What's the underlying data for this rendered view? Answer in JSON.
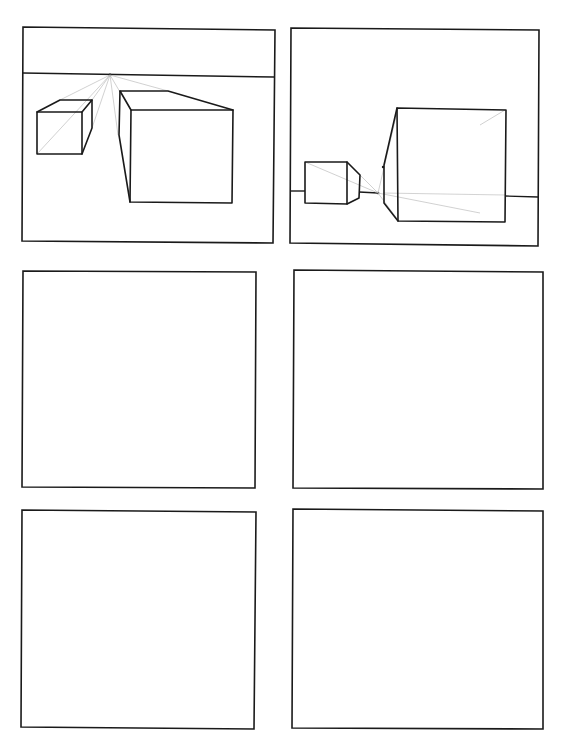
{
  "worksheet": {
    "layout": {
      "rows": 3,
      "columns": 2
    },
    "colors": {
      "ink": "#1a1a1a",
      "construction_lines": "#bdbdbd",
      "paper": "#ffffff"
    },
    "panels": [
      {
        "id": "panel-1",
        "position": "top-left",
        "content": "one-point perspective: horizon line high, vanishing point above two boxes",
        "elements": [
          "horizon-line",
          "vanishing-point",
          "small-cube",
          "large-box",
          "construction-lines"
        ]
      },
      {
        "id": "panel-2",
        "position": "top-right",
        "content": "one-point perspective: horizon line low, vanishing point between two boxes",
        "elements": [
          "horizon-line",
          "vanishing-point",
          "small-box",
          "large-box",
          "construction-lines"
        ]
      },
      {
        "id": "panel-3",
        "position": "middle-left",
        "content": "empty",
        "elements": []
      },
      {
        "id": "panel-4",
        "position": "middle-right",
        "content": "empty",
        "elements": []
      },
      {
        "id": "panel-5",
        "position": "bottom-left",
        "content": "empty",
        "elements": []
      },
      {
        "id": "panel-6",
        "position": "bottom-right",
        "content": "empty",
        "elements": []
      }
    ]
  }
}
